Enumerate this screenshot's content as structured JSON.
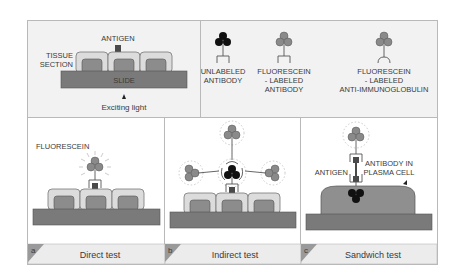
{
  "legend": {
    "antigen": "ANTIGEN",
    "tissue_section": [
      "TISSUE",
      "SECTION"
    ],
    "slide": "SLIDE",
    "exciting_light": "Exciting light",
    "antibodies": [
      {
        "icon": "unlabeled-antibody",
        "label_lines": [
          "UNLABELED",
          "ANTIBODY"
        ]
      },
      {
        "icon": "fluorescein-labeled-antibody",
        "label_lines": [
          "FLUORESCEIN",
          "- LABELED",
          "ANTIBODY"
        ]
      },
      {
        "icon": "fluorescein-labeled-anti-immunoglobulin",
        "label_lines": [
          "FLUORESCEIN",
          "- LABELED",
          "ANTI-IMMUNOGLOBULIN"
        ]
      }
    ]
  },
  "panels": [
    {
      "tag": "a",
      "caption": "Direct test",
      "annotation": "FLUORESCEIN"
    },
    {
      "tag": "b",
      "caption": "Indirect test"
    },
    {
      "tag": "c",
      "caption": "Sandwich test",
      "annotations": [
        "ANTIGEN",
        "ANTIBODY IN",
        "PLASMA CELL"
      ]
    }
  ],
  "colors": {
    "panel_bg": "#f2f2f2",
    "slide": "#7a7a7a",
    "cell_outer": "#dcdcdc",
    "cell_inner": "#8c8c8c",
    "antigen": "#4a4a4a",
    "fluor_circle": "#8a8a8a",
    "unlabeled_circle": "#111111",
    "plasma_cell": "#8f8f8f",
    "caption_bg": "#ececec"
  }
}
